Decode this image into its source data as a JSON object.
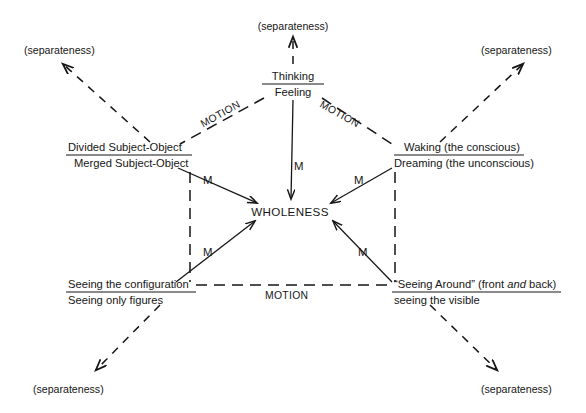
{
  "diagram": {
    "center": {
      "label": "WHOLENESS",
      "x": 290,
      "y": 212
    },
    "nodes": [
      {
        "id": "thinking-feeling",
        "top": "Thinking",
        "bottom": "Feeling",
        "x": 293,
        "y_top": 76,
        "y_bottom": 92,
        "anchor": "middle"
      },
      {
        "id": "subject-object",
        "top": "Divided Subject-Object",
        "bottom": "Merged Subject-Object",
        "x": 68,
        "y_top": 147,
        "y_bottom": 163,
        "anchor": "start"
      },
      {
        "id": "waking-dreaming",
        "top": "Waking (the conscious)",
        "bottom": "Dreaming (the unconscious)",
        "x": 396,
        "y_top": 147,
        "y_bottom": 163,
        "anchor": "start"
      },
      {
        "id": "seeing-configuration",
        "top": "Seeing the configuration",
        "bottom": "Seeing only figures",
        "x": 68,
        "y_top": 284,
        "y_bottom": 300,
        "anchor": "start"
      },
      {
        "id": "seeing-around",
        "top": "“Seeing Around” (front and back)",
        "top_pre": "“Seeing Around” (front ",
        "top_ital": "and",
        "top_post": " back)",
        "bottom": "seeing the visible",
        "x": 396,
        "y_top": 284,
        "y_bottom": 300,
        "anchor": "start"
      }
    ],
    "separateness_labels": [
      {
        "id": "sep-top",
        "text": "(separateness)",
        "x": 293,
        "y": 26,
        "anchor": "middle"
      },
      {
        "id": "sep-top-left",
        "text": "(separateness)",
        "x": 24,
        "y": 50,
        "anchor": "start"
      },
      {
        "id": "sep-top-right",
        "text": "(separateness)",
        "x": 481,
        "y": 50,
        "anchor": "start"
      },
      {
        "id": "sep-bottom-left",
        "text": "(separateness)",
        "x": 33,
        "y": 389,
        "anchor": "start"
      },
      {
        "id": "sep-bottom-right",
        "text": "(separateness)",
        "x": 481,
        "y": 389,
        "anchor": "start"
      }
    ],
    "motion_labels": [
      {
        "id": "motion-upper-left",
        "text": "MOTION",
        "x": 222,
        "y": 117,
        "rotate": -29
      },
      {
        "id": "motion-upper-right",
        "text": "MOTION",
        "x": 336,
        "y": 117,
        "rotate": 29
      },
      {
        "id": "motion-bottom",
        "text": "MOTION",
        "x": 265,
        "y": 296,
        "rotate": 0
      }
    ],
    "m_labels": [
      {
        "id": "m-top",
        "text": "M",
        "x": 294,
        "y": 166
      },
      {
        "id": "m-upper-left",
        "text": "M",
        "x": 203,
        "y": 180
      },
      {
        "id": "m-upper-right",
        "text": "M",
        "x": 354,
        "y": 180
      },
      {
        "id": "m-lower-left",
        "text": "M",
        "x": 203,
        "y": 252
      },
      {
        "id": "m-lower-right",
        "text": "M",
        "x": 358,
        "y": 252
      }
    ],
    "wholeness_arrows": [
      {
        "id": "arrow-from-thinking",
        "x1": 293,
        "y1": 100,
        "x2": 290,
        "y2": 200
      },
      {
        "id": "arrow-from-subject",
        "x1": 178,
        "y1": 168,
        "x2": 258,
        "y2": 204
      },
      {
        "id": "arrow-from-waking",
        "x1": 392,
        "y1": 168,
        "x2": 330,
        "y2": 204
      },
      {
        "id": "arrow-from-seeing-cfg",
        "x1": 176,
        "y1": 282,
        "x2": 256,
        "y2": 220
      },
      {
        "id": "arrow-from-seeing-ard",
        "x1": 392,
        "y1": 282,
        "x2": 332,
        "y2": 220
      }
    ],
    "motion_edges": [
      {
        "id": "edge-thinking-subject",
        "x1": 264,
        "y1": 98,
        "x2": 180,
        "y2": 144
      },
      {
        "id": "edge-thinking-waking",
        "x1": 322,
        "y1": 98,
        "x2": 392,
        "y2": 144
      },
      {
        "id": "edge-left-vertical",
        "x1": 190,
        "y1": 172,
        "x2": 190,
        "y2": 282
      },
      {
        "id": "edge-right-vertical",
        "x1": 395,
        "y1": 172,
        "x2": 395,
        "y2": 282
      },
      {
        "id": "edge-bottom",
        "x1": 196,
        "y1": 285,
        "x2": 390,
        "y2": 285
      }
    ],
    "separateness_arrows": [
      {
        "id": "sep-arrow-top",
        "x1": 293,
        "y1": 64,
        "x2": 293,
        "y2": 36
      },
      {
        "id": "sep-arrow-top-left",
        "x1": 150,
        "y1": 142,
        "x2": 62,
        "y2": 63
      },
      {
        "id": "sep-arrow-top-right",
        "x1": 440,
        "y1": 142,
        "x2": 524,
        "y2": 63
      },
      {
        "id": "sep-arrow-bottom-left",
        "x1": 160,
        "y1": 305,
        "x2": 95,
        "y2": 371
      },
      {
        "id": "sep-arrow-bottom-right",
        "x1": 430,
        "y1": 305,
        "x2": 498,
        "y2": 371
      }
    ],
    "colors": {
      "ink": "#161616",
      "background": "#ffffff"
    }
  }
}
